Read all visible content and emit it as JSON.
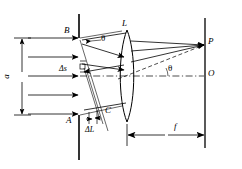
{
  "figure": {
    "type": "optics-ray-diagram",
    "width": 242,
    "height": 169,
    "stroke_color": "#000000",
    "background_color": "#ffffff"
  },
  "labels": {
    "slit_width": "a",
    "slit_top": "B",
    "slit_bottom": "A",
    "wavefront_point": "C",
    "lens": "L",
    "focus_point": "P",
    "axis_point": "O",
    "focal_length": "f",
    "slit_element": "Δs",
    "path_difference": "ΔL",
    "angle_at_slit": "θ",
    "angle_at_axis": "θ"
  },
  "elements": {
    "incoming_rays": {
      "name": "plane-wave-arrows",
      "count": 5,
      "direction": "left-to-right",
      "y_positions": [
        38,
        57,
        76,
        95,
        114
      ],
      "x_start": 28,
      "x_end": 79
    },
    "barrier": {
      "name": "slit-barrier",
      "x": 79,
      "y_top": 14,
      "y_bottom": 160,
      "slit_y_top": 38,
      "slit_y_bottom": 115
    },
    "slit_dimension": {
      "name": "slit-width-dimension",
      "x": 22,
      "y_top": 38,
      "y_bottom": 115
    },
    "diffracted_rays": {
      "name": "diffracted-ray-bundle",
      "count": 3,
      "angle_deg": -17
    },
    "lens": {
      "name": "converging-lens",
      "center_x": 127,
      "center_y": 76,
      "half_height": 46,
      "half_width": 9
    },
    "converging_rays": {
      "name": "converging-rays-to-focus",
      "count": 3,
      "focus_x": 205,
      "focus_y": 45
    },
    "screen": {
      "name": "focal-plane-screen",
      "x": 205,
      "y_top": 18,
      "y_bottom": 148
    },
    "optical_axis": {
      "name": "optical-axis",
      "y": 76,
      "x_start": 79,
      "x_end": 205,
      "style": "dash-dot"
    },
    "focal_dimension": {
      "name": "focal-length-dimension",
      "y": 135,
      "x_start": 127,
      "x_end": 205
    },
    "wavefront_lines": {
      "name": "tilted-wavefront-lines",
      "count": 3
    }
  }
}
